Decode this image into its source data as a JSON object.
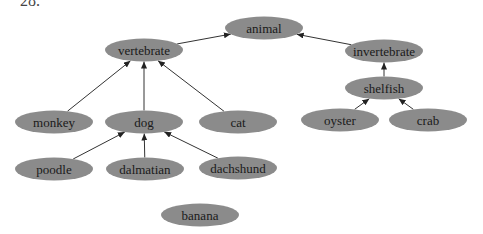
{
  "question_number": "28.",
  "diagram": {
    "type": "hierarchy",
    "nodes": [
      {
        "id": "animal",
        "label": "animal",
        "cx": 264,
        "cy": 28
      },
      {
        "id": "vertebrate",
        "label": "vertebrate",
        "cx": 144,
        "cy": 50
      },
      {
        "id": "invertebrate",
        "label": "invertebrate",
        "cx": 384,
        "cy": 51
      },
      {
        "id": "shelfish",
        "label": "shelfish",
        "cx": 384,
        "cy": 88
      },
      {
        "id": "monkey",
        "label": "monkey",
        "cx": 54,
        "cy": 122
      },
      {
        "id": "dog",
        "label": "dog",
        "cx": 144,
        "cy": 122
      },
      {
        "id": "cat",
        "label": "cat",
        "cx": 238,
        "cy": 122
      },
      {
        "id": "oyster",
        "label": "oyster",
        "cx": 340,
        "cy": 120
      },
      {
        "id": "crab",
        "label": "crab",
        "cx": 428,
        "cy": 120
      },
      {
        "id": "poodle",
        "label": "poodle",
        "cx": 54,
        "cy": 169
      },
      {
        "id": "dalmatian",
        "label": "dalmatian",
        "cx": 145,
        "cy": 169
      },
      {
        "id": "dachshund",
        "label": "dachshund",
        "cx": 238,
        "cy": 168
      },
      {
        "id": "banana",
        "label": "banana",
        "cx": 200,
        "cy": 215
      }
    ],
    "edges": [
      {
        "from": "vertebrate",
        "to": "animal"
      },
      {
        "from": "invertebrate",
        "to": "animal"
      },
      {
        "from": "shelfish",
        "to": "invertebrate"
      },
      {
        "from": "monkey",
        "to": "vertebrate"
      },
      {
        "from": "dog",
        "to": "vertebrate"
      },
      {
        "from": "cat",
        "to": "vertebrate"
      },
      {
        "from": "oyster",
        "to": "shelfish"
      },
      {
        "from": "crab",
        "to": "shelfish"
      },
      {
        "from": "poodle",
        "to": "dog"
      },
      {
        "from": "dalmatian",
        "to": "dog"
      },
      {
        "from": "dachshund",
        "to": "dog"
      }
    ],
    "node_fill": "#8b8b8b",
    "edge_color": "#333333"
  }
}
